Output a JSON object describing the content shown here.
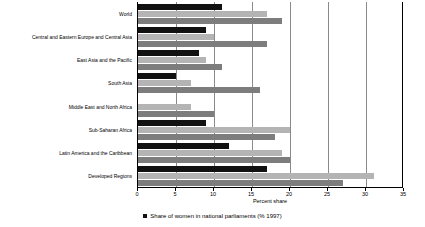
{
  "chart_data": {
    "type": "bar",
    "orientation": "horizontal",
    "title": "",
    "xlabel": "Percent share",
    "ylabel": "",
    "xlim": [
      0,
      35
    ],
    "xticks": [
      0,
      5,
      10,
      15,
      20,
      25,
      30,
      35
    ],
    "grid": true,
    "legend_position": "bottom",
    "categories": [
      "World",
      "Central and Eastern Europe and Central Asia",
      "East Asia and the Pacific",
      "South Asia",
      "Middle East and North Africa",
      "Sub-Saharan Africa",
      "Latin America and the Caribbean",
      "Developed Regions"
    ],
    "series": [
      {
        "name": "Share of women in national parliaments (% 1997)",
        "color": "#111111",
        "values": [
          11,
          9,
          8,
          5,
          0,
          9,
          12,
          17
        ]
      },
      {
        "name": "",
        "color": "#b4b4b4",
        "values": [
          17,
          10,
          9,
          7,
          7,
          20,
          19,
          31
        ]
      },
      {
        "name": "",
        "color": "#7d7d7d",
        "values": [
          19,
          17,
          11,
          16,
          10,
          18,
          20,
          27
        ]
      }
    ],
    "legend": [
      {
        "label": "Share of women in national parliaments (% 1997)",
        "color": "#111111",
        "marker": "square"
      }
    ]
  }
}
